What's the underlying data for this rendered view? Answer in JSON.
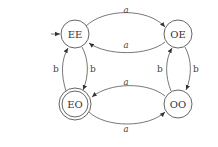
{
  "diagram": {
    "type": "finite-state-automaton",
    "colors": {
      "stroke": "#555555",
      "text": "#333333",
      "background": "#ffffff"
    },
    "states": [
      {
        "id": "EE",
        "label": "EE",
        "initial": true,
        "accepting": false
      },
      {
        "id": "OE",
        "label": "OE",
        "initial": false,
        "accepting": false
      },
      {
        "id": "EO",
        "label": "EO",
        "initial": false,
        "accepting": true
      },
      {
        "id": "OO",
        "label": "OO",
        "initial": false,
        "accepting": false
      }
    ],
    "transitions": [
      {
        "from": "EE",
        "to": "OE",
        "label": "a"
      },
      {
        "from": "OE",
        "to": "EE",
        "label": "a"
      },
      {
        "from": "OO",
        "to": "EO",
        "label": "a"
      },
      {
        "from": "EO",
        "to": "OO",
        "label": "a"
      },
      {
        "from": "EE",
        "to": "EO",
        "label": "b"
      },
      {
        "from": "EO",
        "to": "EE",
        "label": "b"
      },
      {
        "from": "OE",
        "to": "OO",
        "label": "b"
      },
      {
        "from": "OO",
        "to": "OE",
        "label": "b"
      }
    ]
  }
}
